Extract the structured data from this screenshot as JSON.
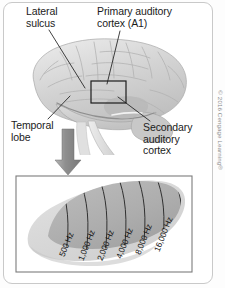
{
  "figure": {
    "copyright": "© 2016 Cengage Learning®"
  },
  "labels": {
    "lateral_sulcus": "Lateral\nsulcus",
    "primary_auditory_cortex": "Primary auditory\ncortex (A1)",
    "temporal_lobe": "Temporal\nlobe",
    "secondary_auditory_cortex": "Secondary\nauditory\ncortex"
  },
  "chart_data": {
    "type": "diagram",
    "categories": [
      "500 Hz",
      "1,000 Hz",
      "2,000 Hz",
      "4,000 Hz",
      "8,000 Hz",
      "16,000 Hz"
    ],
    "values": [
      500,
      1000,
      2000,
      4000,
      8000,
      16000
    ],
    "unit": "Hz",
    "ordering": "low frequency at anterior/left to high frequency at posterior/right"
  },
  "frequency_bands": [
    {
      "label": "500 Hz",
      "x": 66,
      "y": 248,
      "rotate": -68
    },
    {
      "label": "1,000 Hz",
      "x": 85,
      "y": 252,
      "rotate": -68
    },
    {
      "label": "2,000 Hz",
      "x": 104,
      "y": 252,
      "rotate": -68
    },
    {
      "label": "4,000 Hz",
      "x": 123,
      "y": 250,
      "rotate": -68
    },
    {
      "label": "8,000 Hz",
      "x": 142,
      "y": 246,
      "rotate": -68
    },
    {
      "label": "16,000 Hz",
      "x": 161,
      "y": 243,
      "rotate": -68
    }
  ],
  "colors": {
    "brain_fill": "#d2d2d2",
    "cortex_outer": "#d9d9d9",
    "cortex_inner": "#b2b2b2",
    "arrow": "#8c8c8c",
    "leader_line": "#1f1f1f",
    "frame_border": "#c9c9c9",
    "inset_border": "#7c7c7c",
    "text": "#1b1b1b",
    "copyright_text": "#8a8a8a"
  }
}
